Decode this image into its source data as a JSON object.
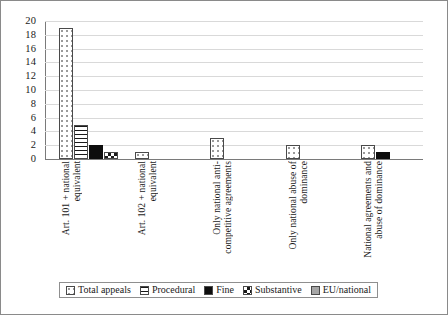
{
  "chart_data": {
    "type": "bar",
    "title": "",
    "xlabel": "",
    "ylabel": "",
    "ylim": [
      0,
      20
    ],
    "ytick_step": 2,
    "yticks": [
      "20",
      "18",
      "16",
      "14",
      "12",
      "10",
      "8",
      "6",
      "4",
      "2",
      "0"
    ],
    "grid": true,
    "legend_position": "bottom",
    "categories": [
      "Art. 101 + national\nequivalent",
      "Art. 102 + national\nequivalent",
      "Only national anti-\ncompetitive agreements",
      "Only national abuse of\ndominance",
      "National agreements  and\nabuse of dominance"
    ],
    "series": [
      {
        "name": "Total appeals",
        "pattern": "dotted",
        "color": "#ffffff",
        "values": [
          19,
          1,
          3,
          2,
          2
        ]
      },
      {
        "name": "Procedural",
        "pattern": "hstripe",
        "color": "#ffffff",
        "values": [
          5,
          0,
          0,
          0,
          0
        ]
      },
      {
        "name": "Fine",
        "pattern": "solid",
        "color": "#0d0d0d",
        "values": [
          2,
          0,
          0,
          0,
          1
        ]
      },
      {
        "name": "Substantive",
        "pattern": "checker",
        "color": "#ffffff",
        "values": [
          1,
          0,
          0,
          0,
          0
        ]
      },
      {
        "name": "EU/national",
        "pattern": "gray",
        "color": "#a6a6a6",
        "values": [
          0,
          0,
          0,
          0,
          0
        ]
      }
    ]
  },
  "axis_color": "#7a7a7a",
  "grid_color": "#d9d9d9",
  "frame_color": "#8a8a8a"
}
